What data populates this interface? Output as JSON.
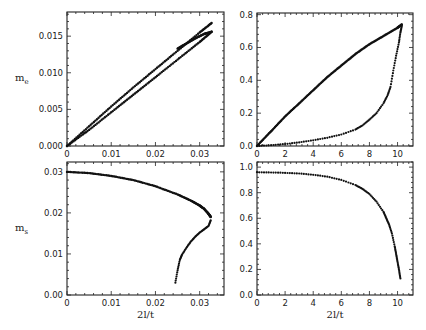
{
  "chart_data": [
    {
      "id": "top-left",
      "type": "scatter",
      "title": "",
      "xlabel": "",
      "ylabel": "m_e",
      "xlim": [
        0,
        0.0355
      ],
      "ylim": [
        0,
        0.0183
      ],
      "xticks": [
        0,
        0.01,
        0.02,
        0.03
      ],
      "xtick_labels": [
        "0",
        "0.01",
        "0.02",
        "0.03"
      ],
      "yticks": [
        0,
        0.005,
        0.01,
        0.015
      ],
      "ytick_labels": [
        "0.000",
        "0.005",
        "0.010",
        "0.015"
      ],
      "frame": {
        "x0": 67,
        "x1": 224,
        "y0": 12,
        "y1": 146
      },
      "series": [
        {
          "name": "upper branch",
          "x": [
            0,
            0.005,
            0.01,
            0.015,
            0.02,
            0.025,
            0.03,
            0.0327
          ],
          "y": [
            0,
            0.0027,
            0.0054,
            0.008,
            0.0105,
            0.013,
            0.0155,
            0.0168
          ]
        },
        {
          "name": "lower branch",
          "x": [
            0,
            0.005,
            0.01,
            0.015,
            0.02,
            0.025,
            0.03,
            0.0327
          ],
          "y": [
            0,
            0.0022,
            0.0046,
            0.007,
            0.0094,
            0.0118,
            0.0142,
            0.0156
          ]
        },
        {
          "name": "return branch",
          "x": [
            0.0327,
            0.031,
            0.029,
            0.027,
            0.025
          ],
          "y": [
            0.0156,
            0.0153,
            0.0147,
            0.014,
            0.0133
          ]
        }
      ]
    },
    {
      "id": "top-right",
      "type": "scatter",
      "title": "",
      "xlabel": "",
      "ylabel": "",
      "xlim": [
        0,
        11.1
      ],
      "ylim": [
        0,
        0.81
      ],
      "xticks": [
        0,
        2,
        4,
        6,
        8,
        10
      ],
      "xtick_labels": [
        "0",
        "2",
        "4",
        "6",
        "8",
        "10"
      ],
      "yticks": [
        0,
        0.2,
        0.4,
        0.6,
        0.8
      ],
      "ytick_labels": [
        "0.0",
        "0.2",
        "0.4",
        "0.6",
        "0.8"
      ],
      "frame": {
        "x0": 257,
        "x1": 413,
        "y0": 13,
        "y1": 146
      },
      "series": [
        {
          "name": "upper curve",
          "x": [
            0,
            1,
            2,
            3,
            4,
            5,
            6,
            7,
            8,
            9,
            10,
            10.3
          ],
          "y": [
            0,
            0.09,
            0.18,
            0.26,
            0.34,
            0.42,
            0.49,
            0.56,
            0.62,
            0.67,
            0.72,
            0.74
          ]
        },
        {
          "name": "lower curve",
          "x": [
            0,
            1,
            2,
            3,
            4,
            5,
            6,
            7,
            7.5,
            8,
            8.5,
            9,
            9.3,
            9.5,
            9.7,
            9.9,
            10.1,
            10.2,
            10.3
          ],
          "y": [
            0,
            0.005,
            0.012,
            0.022,
            0.035,
            0.05,
            0.07,
            0.1,
            0.125,
            0.16,
            0.2,
            0.26,
            0.31,
            0.36,
            0.46,
            0.55,
            0.63,
            0.69,
            0.73
          ]
        }
      ]
    },
    {
      "id": "bottom-left",
      "type": "scatter",
      "title": "",
      "xlabel": "2l/t",
      "ylabel": "m_s",
      "xlim": [
        0,
        0.0355
      ],
      "ylim": [
        0,
        0.0324
      ],
      "xticks": [
        0,
        0.01,
        0.02,
        0.03
      ],
      "xtick_labels": [
        "0",
        "0.01",
        "0.02",
        "0.03"
      ],
      "yticks": [
        0,
        0.01,
        0.02,
        0.03
      ],
      "ytick_labels": [
        "0.00",
        "0.01",
        "0.02",
        "0.03"
      ],
      "frame": {
        "x0": 67,
        "x1": 224,
        "y0": 162,
        "y1": 295
      },
      "series": [
        {
          "name": "upper branch",
          "x": [
            0,
            0.005,
            0.01,
            0.015,
            0.02,
            0.025,
            0.028,
            0.03,
            0.031,
            0.032,
            0.0325
          ],
          "y": [
            0.03,
            0.0297,
            0.029,
            0.028,
            0.0265,
            0.0245,
            0.023,
            0.0218,
            0.021,
            0.0198,
            0.019
          ]
        },
        {
          "name": "lower branch",
          "x": [
            0.0325,
            0.032,
            0.031,
            0.03,
            0.029,
            0.028,
            0.027,
            0.026,
            0.0255,
            0.025,
            0.0245
          ],
          "y": [
            0.0182,
            0.0168,
            0.016,
            0.0152,
            0.0142,
            0.013,
            0.0115,
            0.0098,
            0.0085,
            0.006,
            0.003
          ]
        }
      ]
    },
    {
      "id": "bottom-right",
      "type": "scatter",
      "title": "",
      "xlabel": "2l/t",
      "ylabel": "",
      "xlim": [
        0,
        11.1
      ],
      "ylim": [
        0,
        1.04
      ],
      "xticks": [
        0,
        2,
        4,
        6,
        8,
        10
      ],
      "xtick_labels": [
        "0",
        "2",
        "4",
        "6",
        "8",
        "10"
      ],
      "yticks": [
        0,
        0.2,
        0.4,
        0.6,
        0.8,
        1.0
      ],
      "ytick_labels": [
        "0.0",
        "0.2",
        "0.4",
        "0.6",
        "0.8",
        "1.0"
      ],
      "frame": {
        "x0": 257,
        "x1": 413,
        "y0": 162,
        "y1": 295
      },
      "series": [
        {
          "name": "curve",
          "x": [
            0,
            1,
            2,
            3,
            4,
            5,
            6,
            7,
            7.5,
            8,
            8.5,
            9,
            9.2,
            9.4,
            9.6,
            9.8,
            9.9,
            10.0,
            10.1,
            10.2
          ],
          "y": [
            0.96,
            0.958,
            0.955,
            0.95,
            0.94,
            0.925,
            0.9,
            0.86,
            0.83,
            0.79,
            0.73,
            0.65,
            0.6,
            0.55,
            0.48,
            0.38,
            0.32,
            0.26,
            0.2,
            0.13
          ]
        }
      ]
    }
  ]
}
